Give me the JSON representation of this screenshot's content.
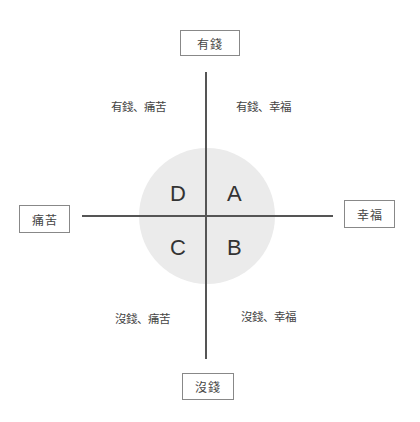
{
  "diagram": {
    "type": "quadrant",
    "axes": {
      "top": "有錢",
      "bottom": "沒錢",
      "left": "痛苦",
      "right": "幸福"
    },
    "quadrant_labels": {
      "top_left": "有錢、痛苦",
      "top_right": "有錢、幸福",
      "bottom_left": "沒錢、痛苦",
      "bottom_right": "沒錢、幸福"
    },
    "center_letters": {
      "top_left": "D",
      "top_right": "A",
      "bottom_left": "C",
      "bottom_right": "B"
    },
    "colors": {
      "circle_fill": "#ebebeb",
      "line": "#555555",
      "box_border": "#888888"
    }
  }
}
